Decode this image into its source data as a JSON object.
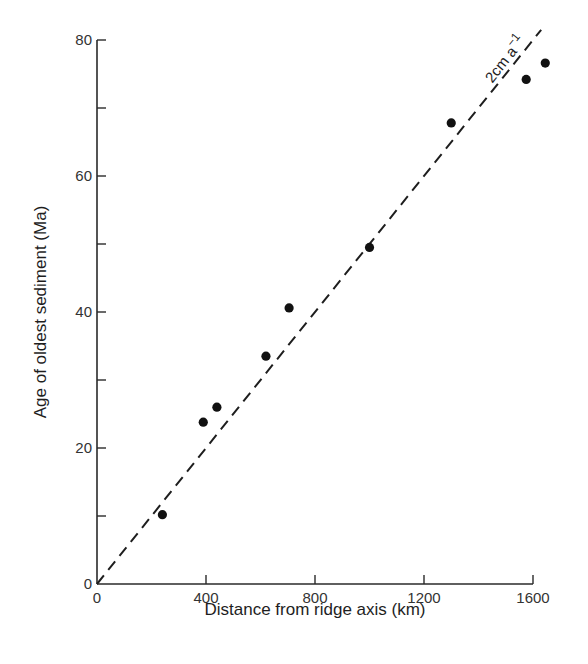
{
  "chart_data": {
    "type": "scatter",
    "title": "",
    "xlabel": "Distance from ridge axis (km)",
    "ylabel": "Age of oldest sediment (Ma)",
    "xlim": [
      0,
      1600
    ],
    "ylim": [
      0,
      80
    ],
    "x_ticks": [
      0,
      400,
      800,
      1200,
      1600
    ],
    "x_tick_labels": [
      "0",
      "400",
      "800",
      "1200",
      "1600"
    ],
    "y_ticks": [
      0,
      20,
      40,
      60,
      80
    ],
    "y_tick_labels": [
      "0",
      "20",
      "40",
      "60",
      "80"
    ],
    "y_minor_ticks": [
      10,
      30,
      50,
      70
    ],
    "grid": false,
    "legend": null,
    "series": [
      {
        "name": "Oldest sediment samples",
        "marker": "filled-circle",
        "x": [
          240,
          390,
          440,
          620,
          705,
          1000,
          1300,
          1575,
          1645
        ],
        "y": [
          10.2,
          23.8,
          26.0,
          33.5,
          40.6,
          49.5,
          67.8,
          74.2,
          76.6
        ]
      }
    ],
    "reference_line": {
      "name": "2 cm a^-1 spreading rate",
      "style": "dashed",
      "x": [
        0,
        1630
      ],
      "y": [
        0,
        81.5
      ]
    },
    "annotations": [
      {
        "text": "2cm a",
        "superscript": "−1",
        "near": "upper end of dashed line, rotated along line"
      }
    ]
  },
  "labels": {
    "xlabel": "Distance from ridge axis (km)",
    "ylabel": "Age of oldest sediment (Ma)",
    "annotation_main": "2cm a",
    "annotation_sup": "−1"
  }
}
